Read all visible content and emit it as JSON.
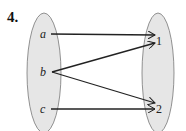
{
  "problem": {
    "number": "4."
  },
  "diagram": {
    "type": "mapping",
    "domain": {
      "elements": [
        "a",
        "b",
        "c"
      ]
    },
    "codomain": {
      "elements": [
        "1",
        "2"
      ]
    },
    "arrows": [
      {
        "from": "a",
        "to": "1"
      },
      {
        "from": "b",
        "to": "1"
      },
      {
        "from": "b",
        "to": "2"
      },
      {
        "from": "c",
        "to": "2"
      }
    ],
    "colors": {
      "ellipse_fill": "#e6e6e6",
      "ellipse_stroke": "#777777",
      "arrow": "#222222"
    }
  }
}
